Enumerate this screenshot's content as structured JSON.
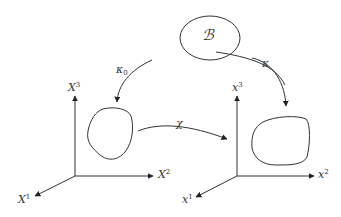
{
  "diagram": {
    "body": {
      "label": "ℬ"
    },
    "maps": {
      "kappa0": {
        "symbol": "κ",
        "subscript": "0"
      },
      "kappa": {
        "symbol": "κ"
      },
      "chi": {
        "symbol": "χ"
      }
    },
    "reference_axes": {
      "x1": {
        "symbol": "X",
        "index": "1"
      },
      "x2": {
        "symbol": "X",
        "index": "2"
      },
      "x3": {
        "symbol": "X",
        "index": "3"
      }
    },
    "current_axes": {
      "x1": {
        "symbol": "x",
        "index": "1"
      },
      "x2": {
        "symbol": "x",
        "index": "2"
      },
      "x3": {
        "symbol": "x",
        "index": "3"
      }
    },
    "colors": {
      "line": "#333333",
      "background": "#ffffff"
    }
  }
}
